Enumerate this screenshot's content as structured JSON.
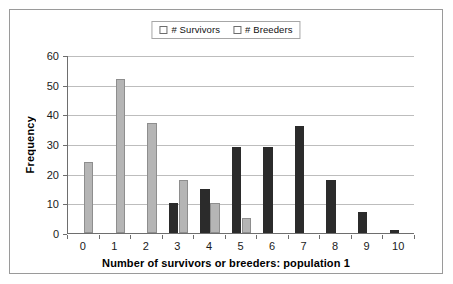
{
  "chart_data": {
    "type": "bar",
    "title": "",
    "xlabel": "Number of survivors or breeders: population 1",
    "ylabel": "Frequency",
    "categories": [
      "0",
      "1",
      "2",
      "3",
      "4",
      "5",
      "6",
      "7",
      "8",
      "9",
      "10"
    ],
    "series": [
      {
        "name": "# Survivors",
        "color": "#2b2b2b",
        "values": [
          0,
          0,
          0,
          10,
          15,
          29,
          29,
          36,
          18,
          7,
          1
        ]
      },
      {
        "name": "# Breeders",
        "color": "#b5b5b5",
        "values": [
          24,
          52,
          37,
          18,
          10,
          5,
          0,
          0,
          0,
          0,
          0
        ]
      }
    ],
    "ylim": [
      0,
      60
    ],
    "ytick_labels": [
      "0",
      "10",
      "20",
      "30",
      "40",
      "50",
      "60"
    ],
    "ytick_values": [
      0,
      10,
      20,
      30,
      40,
      50,
      60
    ],
    "grid": true,
    "legend_position": "top-center"
  },
  "legend": {
    "entries": [
      {
        "label": "# Survivors",
        "swatch": "dark-square-swatch",
        "color": "#2b2b2b"
      },
      {
        "label": "# Breeders",
        "swatch": "light-square-swatch",
        "color": "#b5b5b5"
      }
    ]
  }
}
